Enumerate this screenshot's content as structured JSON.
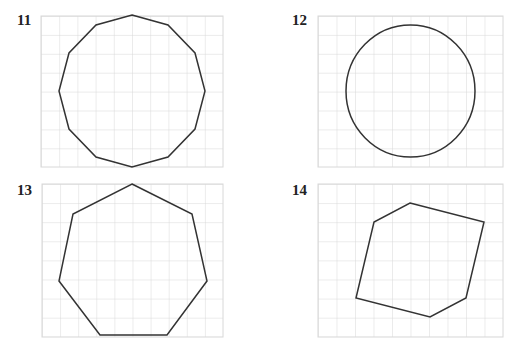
{
  "panels": [
    {
      "number": "11",
      "shape": "dodecagon",
      "label_pos": [
        17,
        12
      ]
    },
    {
      "number": "12",
      "shape": "circle",
      "label_pos": [
        292,
        12
      ]
    },
    {
      "number": "13",
      "shape": "heptagon",
      "label_pos": [
        17,
        182
      ]
    },
    {
      "number": "14",
      "shape": "hexagon",
      "label_pos": [
        292,
        182
      ]
    }
  ],
  "grid": {
    "columns": 10,
    "rows": 8,
    "line_color": "#d8d8d8",
    "stroke_color": "#333333"
  }
}
